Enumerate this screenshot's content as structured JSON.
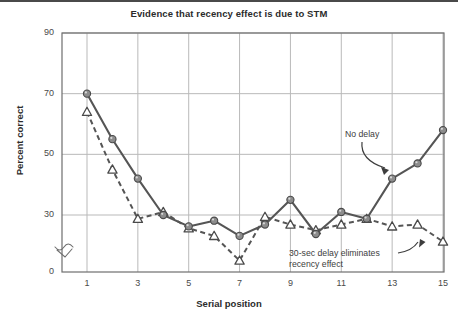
{
  "chart_data": {
    "type": "line",
    "title": "Evidence that recency effect is due to STM",
    "xlabel": "Serial position",
    "ylabel": "Percent correct",
    "x": [
      1,
      2,
      3,
      4,
      5,
      6,
      7,
      8,
      9,
      10,
      11,
      12,
      13,
      14,
      15
    ],
    "xticklabels": [
      "1",
      "3",
      "5",
      "7",
      "9",
      "11",
      "13",
      "15"
    ],
    "xtickvalues": [
      1,
      3,
      5,
      7,
      9,
      11,
      13,
      15
    ],
    "yticklabels": [
      "0",
      "30",
      "50",
      "70",
      "90"
    ],
    "ytickvalues": [
      0,
      30,
      50,
      70,
      90
    ],
    "xlim": [
      0.5,
      15.4
    ],
    "ylim": [
      0,
      90
    ],
    "axis_break": true,
    "grid": true,
    "legend": "annotations",
    "series": [
      {
        "name": "No delay",
        "marker": "filled-circle",
        "linestyle": "solid",
        "color": "#555555",
        "values": [
          70,
          55,
          42,
          30,
          24,
          27,
          19,
          25,
          35,
          20,
          31,
          28,
          42,
          47,
          58
        ]
      },
      {
        "name": "30-sec delay eliminates recency effect",
        "marker": "open-triangle",
        "linestyle": "dashed",
        "color": "#555555",
        "values": [
          64,
          45,
          28,
          31,
          23,
          19,
          6,
          29,
          25,
          22,
          25,
          28,
          24,
          25,
          16
        ]
      }
    ],
    "annotations": [
      {
        "text": "No delay",
        "target_series": "No delay",
        "target_x": 13
      },
      {
        "text": "30-sec delay eliminates\nrecency effect",
        "target_series": "30-sec delay eliminates recency effect",
        "target_x": 14
      }
    ]
  },
  "annotation_no_delay": "No delay",
  "annotation_delay_line1": "30-sec delay eliminates",
  "annotation_delay_line2": "recency effect",
  "colors": {
    "grid": "#b9b9b9",
    "axis": "#6e6e6e",
    "line": "#555555",
    "marker_fill": "#8c8c8c",
    "text": "#3d3d3d",
    "title": "#2b2b2b"
  }
}
